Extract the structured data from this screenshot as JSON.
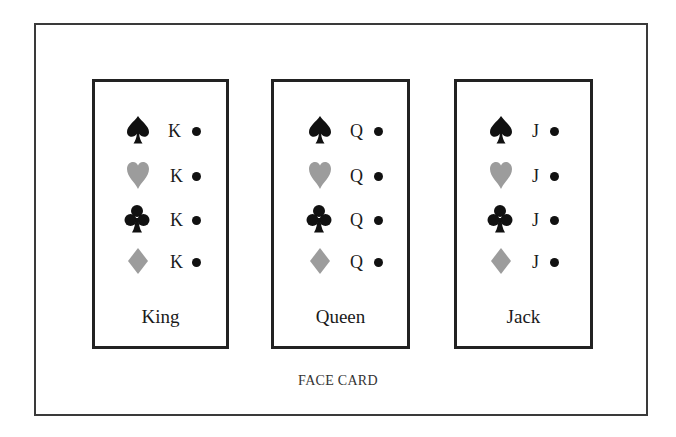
{
  "figure": {
    "caption": "FACE CARD",
    "colors": {
      "black_suit": "#111111",
      "red_suit": "#9c9c9c",
      "border": "#222222"
    }
  },
  "cards": [
    {
      "name": "King",
      "rows": [
        {
          "suit": "spade",
          "rank": "K"
        },
        {
          "suit": "heart",
          "rank": "K"
        },
        {
          "suit": "club",
          "rank": "K"
        },
        {
          "suit": "diamond",
          "rank": "K"
        }
      ]
    },
    {
      "name": "Queen",
      "rows": [
        {
          "suit": "spade",
          "rank": "Q"
        },
        {
          "suit": "heart",
          "rank": "Q"
        },
        {
          "suit": "club",
          "rank": "Q"
        },
        {
          "suit": "diamond",
          "rank": "Q"
        }
      ]
    },
    {
      "name": "Jack",
      "rows": [
        {
          "suit": "spade",
          "rank": "J"
        },
        {
          "suit": "heart",
          "rank": "J"
        },
        {
          "suit": "club",
          "rank": "J"
        },
        {
          "suit": "diamond",
          "rank": "J"
        }
      ]
    }
  ]
}
